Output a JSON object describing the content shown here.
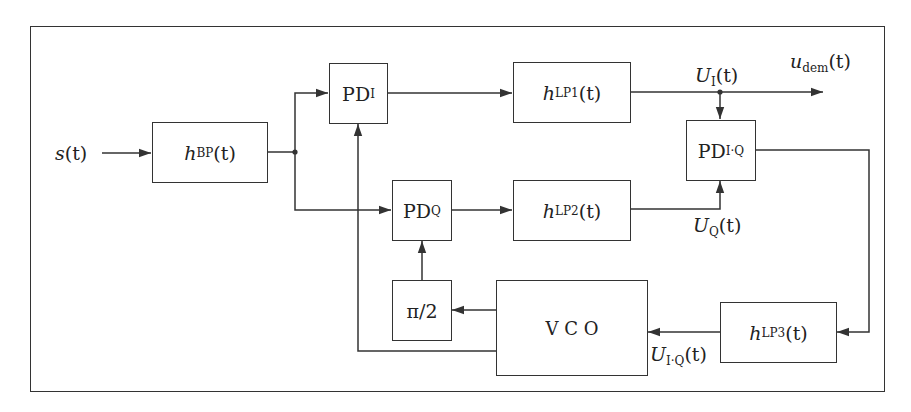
{
  "diagram": {
    "input": {
      "symbol": "s",
      "arg": "(t)"
    },
    "output": {
      "symbol": "u",
      "sub": "dem",
      "arg": "(t)"
    },
    "blocks": {
      "bp": {
        "symbol": "h",
        "sub": "BP",
        "arg": "(t)"
      },
      "pdi": {
        "symbol": "PD",
        "sub": "I"
      },
      "pdq": {
        "symbol": "PD",
        "sub": "Q"
      },
      "lp1": {
        "symbol": "h",
        "sub": "LP1",
        "arg": "(t)"
      },
      "lp2": {
        "symbol": "h",
        "sub": "LP2",
        "arg": "(t)"
      },
      "pdiq": {
        "symbol": "PD",
        "sub": "I·Q"
      },
      "lp3": {
        "symbol": "h",
        "sub": "LP3",
        "arg": "(t)"
      },
      "vco": {
        "label": "V C O"
      },
      "phase": {
        "label": "π/2"
      }
    },
    "signals": {
      "ui": {
        "symbol": "U",
        "sub": "I",
        "arg": "(t)"
      },
      "uq": {
        "symbol": "U",
        "sub": "Q",
        "arg": "(t)"
      },
      "uiq": {
        "symbol": "U",
        "sub": "I·Q",
        "arg": "(t)"
      }
    },
    "colors": {
      "line": "#333333",
      "background": "#ffffff"
    }
  }
}
